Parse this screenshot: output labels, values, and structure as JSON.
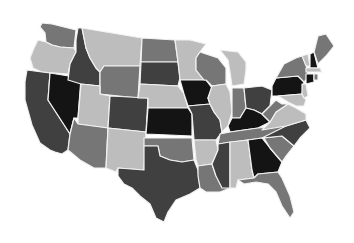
{
  "map": {
    "type": "choropleth",
    "region": "United States (contiguous)",
    "colormap": "grayscale",
    "background": "#ffffff",
    "border_color": "#f2f2f2",
    "shade_levels": {
      "black": "#141414",
      "dark": "#404040",
      "medium": "#767676",
      "light": "#bdbdbd"
    },
    "states": [
      {
        "id": "WA",
        "shade": "medium",
        "points": "42,23 52,24 76,30 74,48 60,47 52,45 46,42 45,33 40,27"
      },
      {
        "id": "OR",
        "shade": "light",
        "points": "38,40 46,42 52,45 60,47 74,48 76,52 70,64 68,74 42,72 33,68 30,58 34,48"
      },
      {
        "id": "CA",
        "shade": "dark",
        "points": "27,70 42,72 50,73 48,100 70,134 68,150 62,154 55,152 50,150 40,143 32,125 25,100 25,82"
      },
      {
        "id": "NV",
        "shade": "black",
        "points": "50,73 81,78 78,118 74,118 70,134 48,100"
      },
      {
        "id": "ID",
        "shade": "dark",
        "points": "78,28 82,28 86,48 90,58 96,68 100,72 100,86 81,84 68,80 70,64 76,52 76,40"
      },
      {
        "id": "MT",
        "shade": "light",
        "points": "82,28 142,38 140,66 104,66 100,72 96,68 90,58 86,48"
      },
      {
        "id": "WY",
        "shade": "medium",
        "points": "104,66 140,66 138,98 100,94 100,72"
      },
      {
        "id": "UT",
        "shade": "light",
        "points": "81,84 100,86 100,94 110,96 108,128 78,124 78,118"
      },
      {
        "id": "AZ",
        "shade": "medium",
        "points": "74,118 78,124 108,128 106,168 94,168 80,160 68,150 70,134"
      },
      {
        "id": "CO",
        "shade": "dark",
        "points": "110,96 148,98 146,132 108,128"
      },
      {
        "id": "NM",
        "shade": "light",
        "points": "108,128 146,132 144,170 118,168 116,172 106,168"
      },
      {
        "id": "ND",
        "shade": "medium",
        "points": "142,38 175,40 178,62 141,62"
      },
      {
        "id": "SD",
        "shade": "dark",
        "points": "141,62 178,62 180,78 178,86 140,84"
      },
      {
        "id": "NE",
        "shade": "light",
        "points": "140,84 178,86 184,94 188,108 148,108 148,98 138,98"
      },
      {
        "id": "KS",
        "shade": "black",
        "points": "148,108 188,108 192,114 192,136 146,134"
      },
      {
        "id": "OK",
        "shade": "medium",
        "points": "144,138 192,138 194,160 182,162 170,160 160,156 158,146 144,146"
      },
      {
        "id": "TX",
        "shade": "dark",
        "points": "144,146 158,146 160,156 170,160 182,162 194,160 198,170 200,188 190,194 176,200 168,212 164,222 156,218 150,204 140,196 132,188 124,184 118,176 118,168 144,170"
      },
      {
        "id": "MN",
        "shade": "light",
        "points": "175,40 190,40 206,44 200,52 196,58 196,70 204,80 180,80 178,62"
      },
      {
        "id": "IA",
        "shade": "black",
        "points": "180,80 206,80 212,88 208,98 210,104 188,106 184,94"
      },
      {
        "id": "MO",
        "shade": "dark",
        "points": "188,106 210,104 214,112 220,120 222,132 216,140 194,140 192,114"
      },
      {
        "id": "AR",
        "shade": "light",
        "points": "194,140 216,140 218,150 212,164 198,166 196,160"
      },
      {
        "id": "LA",
        "shade": "medium",
        "points": "198,166 212,164 216,176 228,178 230,188 220,192 206,192 200,188 198,176"
      },
      {
        "id": "WI",
        "shade": "medium",
        "points": "200,52 218,58 226,68 226,84 212,86 206,80 204,80 196,70 196,58"
      },
      {
        "id": "IL",
        "shade": "light",
        "points": "212,86 226,84 230,92 232,112 228,126 222,132 220,120 214,112 210,104 208,98"
      },
      {
        "id": "MI",
        "shade": "light",
        "points": "220,50 238,52 246,62 246,70 244,84 232,86 230,72 228,60"
      },
      {
        "id": "IN",
        "shade": "medium",
        "points": "232,88 244,88 246,108 240,118 232,118 232,112"
      },
      {
        "id": "OH",
        "shade": "dark",
        "points": "244,88 262,86 272,90 270,106 262,114 254,110 246,108"
      },
      {
        "id": "KY",
        "shade": "black",
        "points": "228,126 232,118 240,118 246,108 254,110 262,114 270,122 258,128 230,132"
      },
      {
        "id": "TN",
        "shade": "medium",
        "points": "220,134 230,132 258,128 286,126 282,136 262,138 218,144"
      },
      {
        "id": "MS",
        "shade": "dark",
        "points": "218,144 230,142 230,188 222,188 216,176 212,164 218,150"
      },
      {
        "id": "AL",
        "shade": "light",
        "points": "230,142 248,140 252,170 254,178 238,180 236,188 230,188"
      },
      {
        "id": "GA",
        "shade": "black",
        "points": "248,140 262,138 270,148 282,162 278,172 258,174 254,178 252,170"
      },
      {
        "id": "FL",
        "shade": "medium",
        "points": "238,180 254,178 258,174 278,172 282,178 290,196 294,212 290,218 282,206 276,192 268,184 256,182 244,184"
      },
      {
        "id": "SC",
        "shade": "medium",
        "points": "264,138 282,136 294,146 286,156 282,162 270,148"
      },
      {
        "id": "NC",
        "shade": "dark",
        "points": "262,138 286,126 306,120 310,128 300,138 294,146 282,136"
      },
      {
        "id": "VA",
        "shade": "light",
        "points": "270,122 276,112 288,104 296,108 306,114 306,120 286,126 262,130"
      },
      {
        "id": "WV",
        "shade": "medium",
        "points": "262,114 270,106 276,100 282,104 288,104 276,112 270,122"
      },
      {
        "id": "PA",
        "shade": "black",
        "points": "272,86 276,78 298,76 304,82 302,94 278,96 272,96"
      },
      {
        "id": "NY",
        "shade": "medium",
        "points": "276,78 284,64 296,58 302,56 306,62 308,78 304,82 298,76"
      },
      {
        "id": "MD",
        "shade": "light",
        "points": "278,96 302,94 306,100 304,106 296,106 288,102"
      },
      {
        "id": "NJ",
        "shade": "light",
        "points": "302,84 306,84 308,96 304,98 302,94"
      },
      {
        "id": "VT",
        "shade": "light",
        "points": "302,56 308,54 310,66 306,66"
      },
      {
        "id": "NH",
        "shade": "black",
        "points": "310,54 314,52 318,68 310,68"
      },
      {
        "id": "ME",
        "shade": "medium",
        "points": "314,52 318,36 326,34 334,46 326,56 318,64"
      },
      {
        "id": "MA",
        "shade": "light",
        "points": "306,68 320,68 322,72 306,72"
      },
      {
        "id": "CT",
        "shade": "black",
        "points": "306,74 314,74 314,82 306,84"
      },
      {
        "id": "RI",
        "shade": "medium",
        "points": "314,74 318,74 318,80 314,80"
      }
    ]
  }
}
